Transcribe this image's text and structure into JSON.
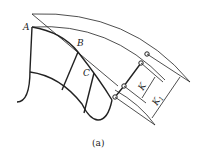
{
  "diagram": {
    "labels": {
      "A": "A",
      "B": "B",
      "C": "C",
      "K": "K",
      "K1": "K",
      "K1_sub": "1"
    },
    "caption": "(a)"
  },
  "colors": {
    "stroke": "#222222",
    "background": "#ffffff"
  }
}
